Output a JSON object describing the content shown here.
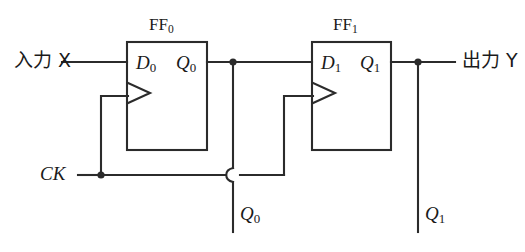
{
  "diagram": {
    "type": "logic-circuit-schematic",
    "stroke_color": "#2b2b2b",
    "background_color": "#ffffff",
    "inputs": {
      "data_label": "入力 X",
      "clock_label": "CK"
    },
    "outputs": {
      "data_label": "出力 Y",
      "tap_q0": "Q",
      "tap_q0_sub": "0",
      "tap_q1": "Q",
      "tap_q1_sub": "1"
    },
    "flipflops": [
      {
        "name": "FF",
        "name_sub": "0",
        "d_port": "D",
        "d_port_sub": "0",
        "q_port": "Q",
        "q_port_sub": "0",
        "clock_edge_triangle": true
      },
      {
        "name": "FF",
        "name_sub": "1",
        "d_port": "D",
        "d_port_sub": "1",
        "q_port": "Q",
        "q_port_sub": "1",
        "clock_edge_triangle": true
      }
    ],
    "junction_dots": 3,
    "wire_hops": 1
  }
}
